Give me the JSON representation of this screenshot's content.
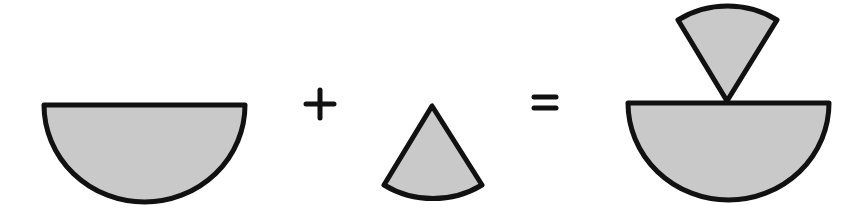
{
  "diagram": {
    "colors": {
      "fill": "#c9c9c9",
      "stroke": "#111111",
      "background": "#ffffff"
    },
    "operators": {
      "plus": "+",
      "equals": "="
    },
    "shapes": [
      {
        "name": "semicircle",
        "label": ""
      },
      {
        "name": "sector",
        "label": ""
      },
      {
        "name": "combined-semicircle-with-inverted-sector",
        "label": ""
      }
    ]
  }
}
